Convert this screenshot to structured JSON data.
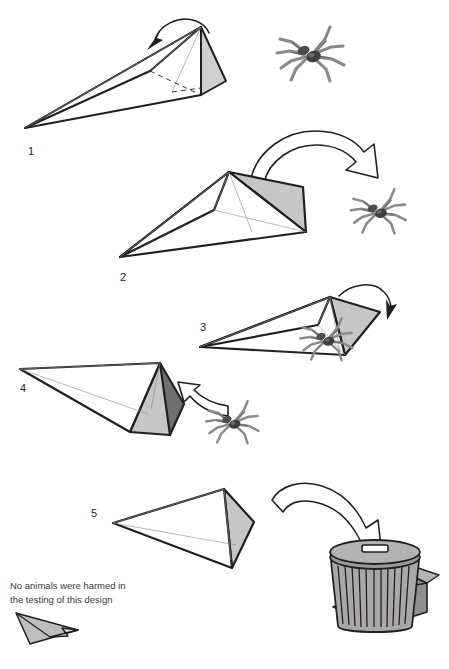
{
  "document": {
    "title": "Paper Plane Bug Catcher Instructions",
    "type": "step-by-step instructional diagram",
    "background_color": "#ffffff",
    "ink_color": "#231f20"
  },
  "palette": {
    "paper_light": "#d0d0d0",
    "paper_mid": "#bdbdbd",
    "paper_dark": "#6f6f6f",
    "paper_white": "#ffffff",
    "spider_body": "#4d4d4d",
    "spider_leg": "#8a8a8a",
    "trash_body": "#a8a8a8",
    "trash_lid": "#9a9a9a",
    "box_body": "#8f8f8f",
    "outline": "#231f20"
  },
  "steps": [
    {
      "id": 1,
      "label": "1",
      "label_x": 28,
      "label_y": 155,
      "description": "Paper dart held open, thin curved arrow shows folding motion over the top; spider sits to the right",
      "arrow_type": "thin-curved",
      "has_spider": true
    },
    {
      "id": 2,
      "label": "2",
      "label_x": 120,
      "label_y": 281,
      "description": "Dart folded closed with shaded grey face; large hollow arrow sweeps to the right toward the spider",
      "arrow_type": "hollow-curved",
      "has_spider": true
    },
    {
      "id": 3,
      "label": "3",
      "label_x": 200,
      "label_y": 331,
      "description": "Dart lowered over the spider, thin curved arrow points down onto the spider",
      "arrow_type": "thin-curved",
      "has_spider": true
    },
    {
      "id": 4,
      "label": "4",
      "label_x": 20,
      "label_y": 392,
      "description": "Dart nose opened showing dark interior pocket; hollow arrow shows spider being scooped inside",
      "arrow_type": "hollow-curved",
      "has_spider": true
    },
    {
      "id": 5,
      "label": "5",
      "label_x": 91,
      "label_y": 517,
      "description": "Dart with spider inside; large hollow arrow sweeps right toward the rubbish bin",
      "arrow_type": "hollow-curved",
      "has_spider": false
    }
  ],
  "caption": {
    "line1": "No animals were harmed in",
    "line2": "the testing of this design",
    "line1_x": 10,
    "line1_y": 589,
    "line2_x": 10,
    "line2_y": 603,
    "icon": "paper-plane-icon"
  },
  "objects": {
    "spider": {
      "name": "spider-icon",
      "legs": 8,
      "instances": [
        {
          "x": 310,
          "y": 55,
          "scale": 1.0
        },
        {
          "x": 378,
          "y": 212,
          "scale": 0.82
        },
        {
          "x": 326,
          "y": 340,
          "scale": 0.78
        },
        {
          "x": 232,
          "y": 423,
          "scale": 0.78
        }
      ]
    },
    "trash_can": {
      "name": "trash-can-icon",
      "x": 330,
      "y": 543,
      "rib_count": 11
    },
    "cardboard_box": {
      "name": "cardboard-box-icon",
      "x": 388,
      "y": 580
    },
    "plunger": {
      "name": "plunger-icon",
      "x": 396,
      "y": 590
    },
    "fish_bones": {
      "name": "fish-bones-icon",
      "x": 345,
      "y": 615
    }
  }
}
